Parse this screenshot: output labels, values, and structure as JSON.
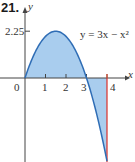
{
  "problem_number": "21.",
  "chart_data": {
    "type": "area",
    "title": "",
    "function": "y = 3x - x^2",
    "equation_label": "y = 3x − x²",
    "x_domain": [
      0,
      4
    ],
    "xlim": [
      -0.5,
      4.4
    ],
    "ylim": [
      -4,
      2.6
    ],
    "xlabel": "x",
    "ylabel": "y",
    "origin_label": "0",
    "x_ticks": [
      1,
      2,
      3,
      4
    ],
    "x_tick_labels": [
      "1",
      "2",
      "3",
      "4"
    ],
    "y_ticks": [
      2.25
    ],
    "y_tick_labels": [
      "2.25"
    ],
    "vertical_line_x": 4,
    "shaded_region": "between curve and x-axis for 0 ≤ x ≤ 4",
    "colors": {
      "curve": "#2f6db5",
      "fill": "#a9cdee",
      "vertical_line": "#d9302a",
      "axis": "#444444",
      "tick_green": "#5a9e5a"
    }
  }
}
